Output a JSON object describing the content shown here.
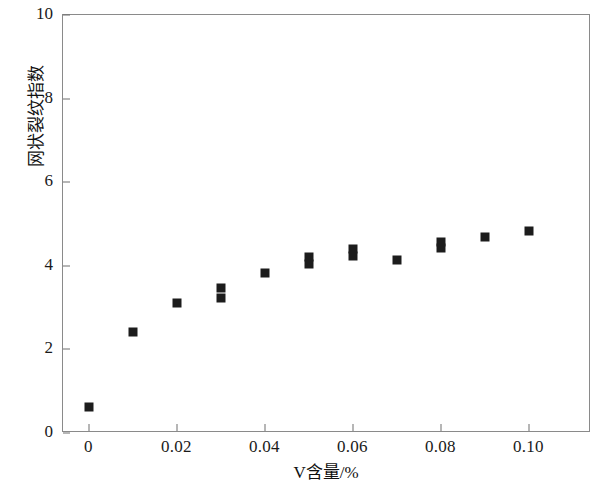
{
  "chart_data": {
    "type": "scatter",
    "title": "",
    "xlabel": "V含量/%",
    "ylabel": "网状裂纹指数",
    "xlim": [
      -0.006,
      0.114
    ],
    "ylim": [
      0,
      10
    ],
    "xticks": [
      0,
      0.02,
      0.04,
      0.06,
      0.08,
      0.1
    ],
    "xticklabels": [
      "0",
      "0.02",
      "0.04",
      "0.06",
      "0.08",
      "0.10"
    ],
    "yticks": [
      0,
      2,
      4,
      6,
      8,
      10
    ],
    "yticklabels": [
      "0",
      "2",
      "4",
      "6",
      "8",
      "10"
    ],
    "grid": false,
    "legend": null,
    "marker": "square",
    "marker_color": "#1c1c1c",
    "frame_color": "#8a8a8a",
    "points": [
      {
        "x": 0.0,
        "y": 0.63
      },
      {
        "x": 0.01,
        "y": 2.42
      },
      {
        "x": 0.02,
        "y": 3.12
      },
      {
        "x": 0.03,
        "y": 3.47
      },
      {
        "x": 0.03,
        "y": 3.22
      },
      {
        "x": 0.04,
        "y": 3.83
      },
      {
        "x": 0.05,
        "y": 4.22
      },
      {
        "x": 0.05,
        "y": 4.04
      },
      {
        "x": 0.06,
        "y": 4.41
      },
      {
        "x": 0.06,
        "y": 4.24
      },
      {
        "x": 0.07,
        "y": 4.13
      },
      {
        "x": 0.08,
        "y": 4.56
      },
      {
        "x": 0.08,
        "y": 4.42
      },
      {
        "x": 0.09,
        "y": 4.68
      },
      {
        "x": 0.1,
        "y": 4.83
      }
    ]
  }
}
